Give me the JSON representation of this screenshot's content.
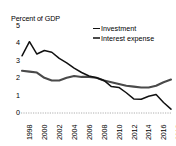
{
  "chart_data": {
    "type": "line",
    "title": "Percent of GDP",
    "xlabel": "",
    "ylabel": "Percent of GDP",
    "ylim": [
      0,
      5
    ],
    "yticks": [
      "0",
      "1",
      "2",
      "3",
      "4",
      "5"
    ],
    "grid": false,
    "legend_position": "top-right",
    "x": [
      1998,
      1999,
      2000,
      2001,
      2002,
      2003,
      2004,
      2005,
      2006,
      2007,
      2008,
      2009,
      2010,
      2011,
      2012,
      2013,
      2014,
      2015,
      2016,
      2017,
      2018
    ],
    "xticks": [
      "1998",
      "2000",
      "2002",
      "2004",
      "2006",
      "2008",
      "2010",
      "2012",
      "2014",
      "2016",
      "2018"
    ],
    "series": [
      {
        "name": "Investment",
        "color": "#111111",
        "values": [
          3.25,
          4.05,
          3.35,
          3.55,
          3.45,
          3.1,
          2.85,
          2.55,
          2.3,
          2.1,
          2.0,
          1.85,
          1.5,
          1.45,
          1.15,
          0.8,
          0.78,
          0.95,
          1.05,
          0.6,
          0.22
        ]
      },
      {
        "name": "Interest expense",
        "color": "#4a4a4a",
        "values": [
          2.4,
          2.35,
          2.3,
          2.0,
          1.85,
          1.85,
          2.0,
          2.1,
          2.05,
          2.05,
          2.0,
          1.85,
          1.75,
          1.65,
          1.55,
          1.5,
          1.45,
          1.45,
          1.55,
          1.75,
          1.9
        ]
      }
    ]
  },
  "legend": {
    "items": [
      {
        "label": "Investment"
      },
      {
        "label": "Interest expense"
      }
    ]
  },
  "axis": {
    "title": "Percent of GDP",
    "y5": "5",
    "y4": "4",
    "y3": "3",
    "y2": "2",
    "y1": "1",
    "y0": "0"
  },
  "xlabels": {
    "l0": "1998",
    "l1": "2000",
    "l2": "2002",
    "l3": "2004",
    "l4": "2006",
    "l5": "2008",
    "l6": "2010",
    "l7": "2012",
    "l8": "2014",
    "l9": "2016",
    "l10": "2018"
  }
}
